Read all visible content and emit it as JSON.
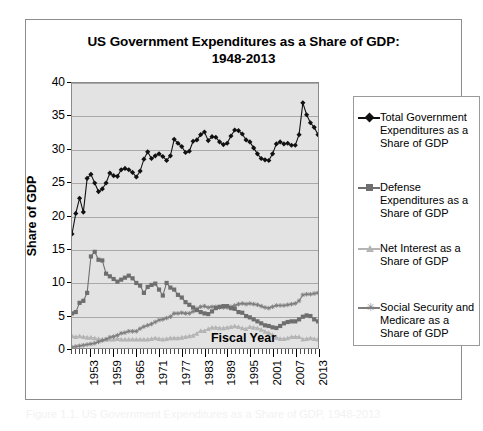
{
  "figure": {
    "title_line1": "US Government Expenditures as a Share of GDP:",
    "title_line2": "1948-2013",
    "caption": "Figure 1.1.  US Government Expenditures as a Share of GDP, 1948-2013"
  },
  "legend": {
    "items": [
      {
        "label": "Total Government Expenditures as a Share of GDP",
        "marker": "diamond-marker",
        "color": "#111111"
      },
      {
        "label": "Defense Expenditures as a Share of GDP",
        "marker": "square-marker",
        "color": "#6e6e6e"
      },
      {
        "label": "Net Interest as a Share of GDP",
        "marker": "triangle-marker",
        "color": "#b4b4b4"
      },
      {
        "label": "Social Security and Medicare as a Share of GDP",
        "marker": "star-marker",
        "color": "#7d7d7d"
      }
    ]
  },
  "chart_data": {
    "type": "line",
    "title": "US Government Expenditures as a Share of GDP: 1948-2013",
    "xlabel": "Fiscal Year",
    "ylabel": "Share of GDP",
    "xlim": [
      1948,
      2013
    ],
    "ylim": [
      0,
      40
    ],
    "ytick_labels": [
      "0",
      "5",
      "10",
      "15",
      "20",
      "25",
      "30",
      "35",
      "40"
    ],
    "ytick_values": [
      0,
      5,
      10,
      15,
      20,
      25,
      30,
      35,
      40
    ],
    "xtick_labels": [
      "1953",
      "1959",
      "1965",
      "1971",
      "1977",
      "1983",
      "1989",
      "1995",
      "2001",
      "2007",
      "2013"
    ],
    "xtick_values": [
      1953,
      1959,
      1965,
      1971,
      1977,
      1983,
      1989,
      1995,
      2001,
      2007,
      2013
    ],
    "grid": "horizontal",
    "legend_position": "right",
    "x": [
      1948,
      1949,
      1950,
      1951,
      1952,
      1953,
      1954,
      1955,
      1956,
      1957,
      1958,
      1959,
      1960,
      1961,
      1962,
      1963,
      1964,
      1965,
      1966,
      1967,
      1968,
      1969,
      1970,
      1971,
      1972,
      1973,
      1974,
      1975,
      1976,
      1977,
      1978,
      1979,
      1980,
      1981,
      1982,
      1983,
      1984,
      1985,
      1986,
      1987,
      1988,
      1989,
      1990,
      1991,
      1992,
      1993,
      1994,
      1995,
      1996,
      1997,
      1998,
      1999,
      2000,
      2001,
      2002,
      2003,
      2004,
      2005,
      2006,
      2007,
      2008,
      2009,
      2010,
      2011,
      2012,
      2013
    ],
    "series": [
      {
        "name": "Total Government Expenditures as a Share of GDP",
        "color": "#111111",
        "marker": "diamond",
        "values": [
          17.2,
          20.3,
          22.6,
          20.5,
          25.6,
          26.2,
          24.9,
          23.6,
          24.0,
          24.9,
          26.4,
          26.0,
          25.9,
          26.9,
          27.1,
          26.9,
          26.5,
          25.8,
          26.7,
          28.5,
          29.6,
          28.6,
          29.0,
          29.3,
          28.9,
          28.3,
          29.0,
          31.5,
          30.9,
          30.4,
          29.5,
          29.7,
          31.2,
          31.4,
          32.2,
          32.6,
          31.3,
          31.9,
          31.8,
          31.1,
          30.7,
          30.9,
          32.0,
          32.9,
          32.8,
          32.3,
          31.4,
          31.1,
          30.2,
          29.3,
          28.6,
          28.4,
          28.3,
          29.3,
          30.8,
          31.1,
          30.8,
          30.9,
          30.6,
          30.6,
          32.2,
          37.0,
          35.2,
          34.0,
          33.3,
          32.2
        ]
      },
      {
        "name": "Defense Expenditures as a Share of GDP",
        "color": "#6e6e6e",
        "marker": "square",
        "values": [
          5.2,
          5.4,
          6.8,
          7.1,
          8.3,
          13.8,
          14.5,
          13.3,
          13.2,
          11.2,
          10.8,
          10.4,
          10.0,
          10.3,
          10.6,
          10.9,
          10.5,
          9.8,
          9.4,
          8.3,
          9.2,
          9.5,
          9.7,
          8.8,
          7.9,
          9.8,
          9.1,
          8.8,
          8.0,
          7.6,
          6.9,
          6.5,
          6.1,
          5.7,
          5.4,
          5.2,
          5.1,
          5.5,
          6.0,
          6.2,
          6.3,
          6.3,
          6.0,
          5.9,
          5.4,
          5.3,
          4.8,
          4.6,
          4.3,
          4.0,
          3.7,
          3.4,
          3.3,
          3.1,
          3.0,
          3.3,
          3.7,
          3.9,
          4.0,
          4.0,
          4.3,
          4.7,
          4.9,
          4.8,
          4.3,
          4.0
        ]
      },
      {
        "name": "Net Interest as a Share of GDP",
        "color": "#b4b4b4",
        "marker": "triangle",
        "values": [
          1.8,
          1.7,
          1.8,
          1.7,
          1.6,
          1.6,
          1.5,
          1.4,
          1.3,
          1.3,
          1.3,
          1.3,
          1.4,
          1.3,
          1.3,
          1.3,
          1.3,
          1.3,
          1.3,
          1.3,
          1.3,
          1.4,
          1.5,
          1.4,
          1.3,
          1.4,
          1.5,
          1.5,
          1.5,
          1.6,
          1.7,
          1.8,
          1.9,
          2.2,
          2.6,
          2.6,
          2.9,
          3.1,
          3.1,
          3.0,
          3.0,
          3.1,
          3.2,
          3.3,
          3.2,
          3.0,
          2.9,
          3.2,
          3.1,
          3.0,
          2.8,
          2.5,
          2.3,
          2.0,
          1.6,
          1.4,
          1.4,
          1.5,
          1.7,
          1.7,
          1.7,
          1.3,
          1.4,
          1.5,
          1.4,
          1.3
        ]
      },
      {
        "name": "Social Security and Medicare as a Share of GDP",
        "color": "#7d7d7d",
        "marker": "star",
        "values": [
          0.1,
          0.2,
          0.3,
          0.4,
          0.5,
          0.6,
          0.7,
          0.9,
          1.1,
          1.3,
          1.6,
          1.7,
          1.9,
          2.2,
          2.3,
          2.5,
          2.5,
          2.5,
          2.9,
          3.2,
          3.4,
          3.6,
          3.9,
          4.2,
          4.3,
          4.5,
          4.7,
          5.2,
          5.2,
          5.3,
          5.2,
          5.2,
          5.5,
          5.9,
          6.2,
          6.3,
          6.1,
          6.2,
          6.2,
          6.1,
          6.1,
          6.1,
          6.2,
          6.4,
          6.6,
          6.7,
          6.6,
          6.7,
          6.6,
          6.5,
          6.3,
          6.1,
          6.0,
          6.2,
          6.4,
          6.4,
          6.4,
          6.5,
          6.6,
          6.7,
          7.1,
          8.0,
          8.1,
          8.1,
          8.2,
          8.3
        ]
      }
    ]
  }
}
